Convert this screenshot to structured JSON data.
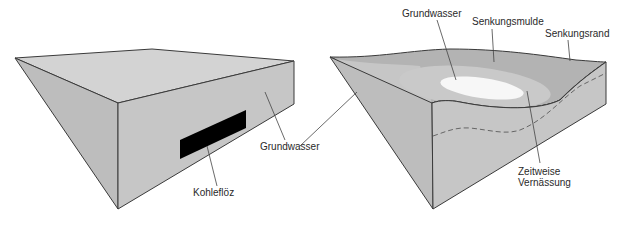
{
  "left_block": {
    "labels": {
      "coal_seam": "Kohleflöz",
      "groundwater": "Grundwasser"
    }
  },
  "right_block": {
    "labels": {
      "groundwater": "Grundwasser",
      "subsidence_basin": "Senkungsmulde",
      "subsidence_edge": "Senkungsrand",
      "waterlogging_line1": "Zeitweise",
      "waterlogging_line2": "Vernässung"
    }
  },
  "colors": {
    "top_face": "#cfcfcf",
    "left_face": "#bdbdbd",
    "front_face": "#c8c8c8",
    "edge": "#3a3a3a",
    "coal": "#000000",
    "basin_dark": "#a9a9a9",
    "basin_mid": "#c2c2c2",
    "water": "#f7f7f7"
  }
}
